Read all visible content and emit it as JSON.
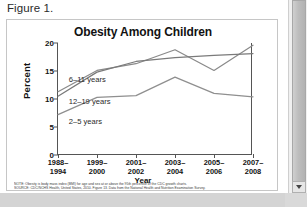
{
  "document": {
    "figure_caption": "Figure 1."
  },
  "scrollbar": {
    "down_arrow_icon": "chevron-down-icon"
  },
  "chart_data": {
    "type": "line",
    "title": "Obesity Among Children",
    "xlabel": "Year",
    "ylabel": "Percent",
    "ylim": [
      0,
      20
    ],
    "yticks": [
      0,
      5,
      10,
      15,
      20
    ],
    "grid": false,
    "legend_position": "inline-labels",
    "categories": [
      "1988–1994",
      "1999–2000",
      "2001–2002",
      "2003–2004",
      "2005–2006",
      "2007–2008"
    ],
    "category_lines": [
      [
        "1988–",
        "1994"
      ],
      [
        "1999–",
        "2000"
      ],
      [
        "2001–",
        "2002"
      ],
      [
        "2003–",
        "2004"
      ],
      [
        "2005–",
        "2006"
      ],
      [
        "2007–",
        "2008"
      ]
    ],
    "series": [
      {
        "name": "6–11 years",
        "values": [
          11.3,
          15.1,
          16.3,
          18.8,
          15.1,
          19.6
        ],
        "color": "#8a8a8a"
      },
      {
        "name": "12–19 years",
        "values": [
          10.5,
          14.8,
          16.7,
          17.4,
          17.8,
          18.1
        ],
        "color": "#7a7a7a"
      },
      {
        "name": "2–5 years",
        "values": [
          7.2,
          10.3,
          10.6,
          13.9,
          11.0,
          10.4
        ],
        "color": "#8f8f8f"
      }
    ],
    "annotations": [
      {
        "text": "6–11 years",
        "x_frac": 0.055,
        "y_value": 13.6
      },
      {
        "text": "12–19 years",
        "x_frac": 0.055,
        "y_value": 9.6
      },
      {
        "text": "2–5 years",
        "x_frac": 0.055,
        "y_value": 6.1
      }
    ]
  },
  "footnotes": {
    "note": "NOTE: Obesity is body mass index (BMI) for age and sex at or above the 95th percentile of the CDC growth charts.",
    "source": "SOURCE: CDC/NCHS Health, United States, 2010. Figure 13. Data from the National Health and Nutrition Examination Survey."
  }
}
